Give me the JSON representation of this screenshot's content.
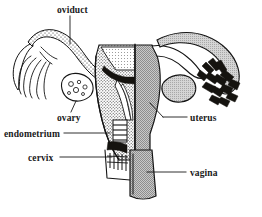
{
  "figure": {
    "style": "black and white line engraving",
    "background_color": "#ffffff",
    "ink_color": "#141414",
    "width": 262,
    "height": 217
  },
  "labels": [
    {
      "id": "oviduct",
      "text": "oviduct",
      "position": "top-center",
      "leader": "vertical line descending to left oviduct tube"
    },
    {
      "id": "ovary",
      "text": "ovary",
      "position": "upper-left",
      "leader": "short line ascending to left ovary"
    },
    {
      "id": "endometrium",
      "text": "endometrium",
      "position": "mid-left",
      "leader": "horizontal line to stippled uterine lining"
    },
    {
      "id": "cervix",
      "text": "cervix",
      "position": "lower-left",
      "leader": "horizontal line to cervical canal"
    },
    {
      "id": "uterus",
      "text": "uterus",
      "position": "mid-right",
      "leader": "line angling left-down to uterine body"
    },
    {
      "id": "vagina",
      "text": "vagina",
      "position": "lower-right",
      "leader": "horizontal line to vaginal canal"
    }
  ],
  "structures": [
    {
      "id": "left-fimbriae",
      "name": "fimbriae (left)",
      "rendering": "thin outlined finger-like projections fanning outward"
    },
    {
      "id": "left-oviduct",
      "name": "oviduct (left)",
      "rendering": "stippled curving tube"
    },
    {
      "id": "left-ovary",
      "name": "ovary (left)",
      "rendering": "irregular blob containing small follicle circles"
    },
    {
      "id": "endometrium-lining",
      "name": "endometrium",
      "rendering": "dense stippled layer lining the cut-away uterine wall"
    },
    {
      "id": "uterine-cavity",
      "name": "uterine cavity",
      "rendering": "white triangular void with dark myometrium border"
    },
    {
      "id": "uterus-body",
      "name": "uterus",
      "rendering": "right half solid gray external view, left half cut-away section"
    },
    {
      "id": "cervix-canal",
      "name": "cervix",
      "rendering": "dark mass with ridged canal and comb-like striations"
    },
    {
      "id": "vagina-canal",
      "name": "vagina",
      "rendering": "checkered gray textured tube widening downward"
    },
    {
      "id": "right-oviduct",
      "name": "oviduct (right)",
      "rendering": "gray-shaded arching tube"
    },
    {
      "id": "right-ovary",
      "name": "ovary (right)",
      "rendering": "plain light gray oval blob"
    },
    {
      "id": "right-fimbriae",
      "name": "fimbriae (right)",
      "rendering": "heavy dark spiky projections"
    }
  ]
}
